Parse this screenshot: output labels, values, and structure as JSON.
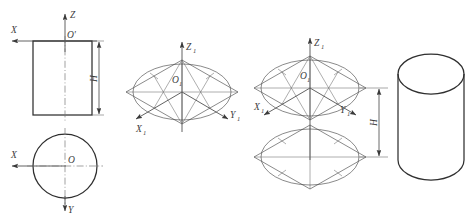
{
  "drawing": {
    "title": "Isometric projection construction of a cylinder",
    "line_color": "#2f2f2f",
    "construction_color": "#6b6b6b",
    "center_line_color": "#7a7a7a",
    "background": "#ffffff"
  },
  "step1": {
    "name": "orthographic-views",
    "front_view": {
      "shape": "rectangle",
      "origin_label": "O'",
      "z_axis_label": "Z",
      "x_axis_label": "X",
      "height_dimension_label": "H"
    },
    "top_view": {
      "shape": "circle",
      "origin_label": "O",
      "x_axis_label": "X",
      "y_axis_label": "Y"
    }
  },
  "step2": {
    "name": "isometric-rhombus-with-ellipse",
    "origin_label": "O",
    "origin_subscript": "1",
    "z_axis_label": "Z",
    "z_axis_subscript": "1",
    "x_axis_label": "X",
    "x_axis_subscript": "1",
    "y_axis_label": "Y",
    "y_axis_subscript": "1"
  },
  "step3": {
    "name": "stacked-rhombi-with-height",
    "origin_label": "O",
    "origin_subscript": "1",
    "z_axis_label": "Z",
    "z_axis_subscript": "1",
    "x_axis_label": "X",
    "x_axis_subscript": "1",
    "y_axis_label": "Y",
    "y_axis_subscript": "1",
    "height_dimension_label": "H"
  },
  "step4": {
    "name": "finished-cylinder",
    "shape": "cylinder"
  }
}
